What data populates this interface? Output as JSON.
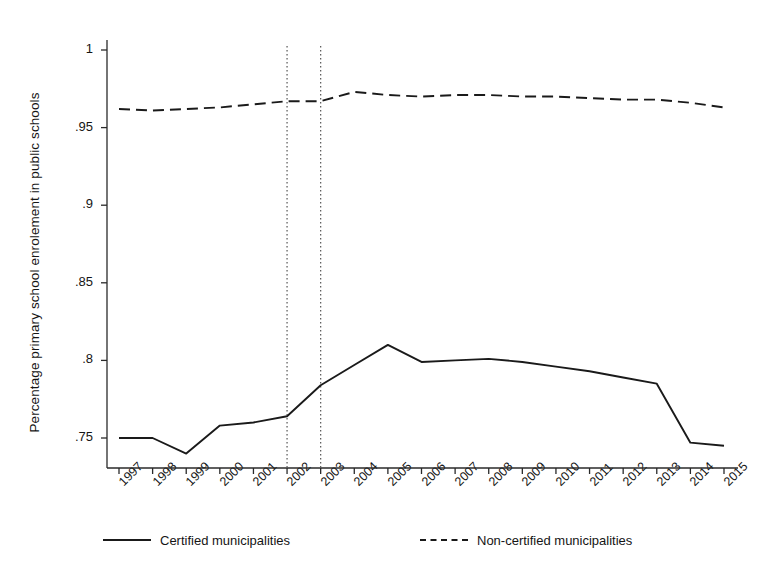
{
  "chart_data": {
    "type": "line",
    "title": "",
    "xlabel": "",
    "ylabel": "Percentage primary school enrolement in public schools",
    "x": [
      1997,
      1998,
      1999,
      2000,
      2001,
      2002,
      2003,
      2004,
      2005,
      2006,
      2007,
      2008,
      2009,
      2010,
      2011,
      2012,
      2013,
      2014,
      2015
    ],
    "categories": [
      "1997",
      "1998",
      "1999",
      "2000",
      "2001",
      "2002",
      "2003",
      "2004",
      "2005",
      "2006",
      "2007",
      "2008",
      "2009",
      "2010",
      "2011",
      "2012",
      "2013",
      "2014",
      "2015"
    ],
    "series": [
      {
        "name": "Certified municipalities",
        "style": "solid",
        "color": "#1a1a1a",
        "values": [
          0.75,
          0.75,
          0.74,
          0.758,
          0.76,
          0.764,
          0.784,
          0.797,
          0.81,
          0.799,
          0.8,
          0.801,
          0.799,
          0.796,
          0.793,
          0.789,
          0.785,
          0.747,
          0.745
        ]
      },
      {
        "name": "Non-certified municipalities",
        "style": "dashed",
        "color": "#1a1a1a",
        "values": [
          0.962,
          0.961,
          0.962,
          0.963,
          0.965,
          0.967,
          0.967,
          0.973,
          0.971,
          0.97,
          0.971,
          0.971,
          0.97,
          0.97,
          0.969,
          0.968,
          0.968,
          0.966,
          0.963
        ]
      }
    ],
    "yticks": [
      1,
      0.95,
      0.9,
      0.85,
      0.8,
      0.75
    ],
    "ytick_labels": [
      "1",
      ".95",
      ".9",
      ".85",
      ".8",
      ".75"
    ],
    "ylim": [
      0.7325,
      1.0065
    ],
    "xlim": [
      1996.65,
      2015.35
    ],
    "grid": false,
    "legend_position": "bottom",
    "annotations": [
      {
        "type": "vline",
        "x": 2002,
        "style": "dotted",
        "color": "#555555"
      },
      {
        "type": "vline",
        "x": 2003,
        "style": "dotted",
        "color": "#555555"
      }
    ]
  },
  "legend": {
    "entries": [
      {
        "label": "Certified municipalities"
      },
      {
        "label": "Non-certified municipalities"
      }
    ]
  }
}
